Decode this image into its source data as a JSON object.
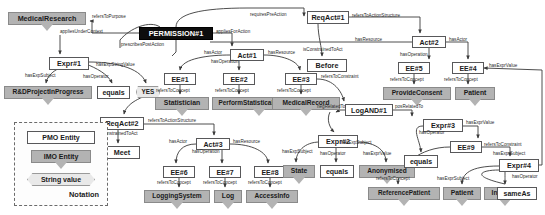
{
  "diagram": {
    "colors": {
      "pmo_fill": "#ffffff",
      "imo_fill": "#b3b3b3",
      "string_fill": "#e9e9e9",
      "permission_fill": "#0d0d0d",
      "edge": "#3a3a3a"
    }
  },
  "legend": {
    "items": [
      {
        "label": "PMO Entity",
        "kind": "pmo"
      },
      {
        "label": "IMO Entity",
        "kind": "imo"
      },
      {
        "label": "String value",
        "kind": "strval"
      }
    ],
    "note": "Notation"
  },
  "nodes": [
    {
      "id": "medicalresearch",
      "label": "MedicalResearch",
      "kind": "imo",
      "x": 8,
      "y": 12,
      "w": 78,
      "h": 13,
      "fs": 7.2
    },
    {
      "id": "permission1",
      "label": "PERMISSION#1",
      "kind": "perm",
      "x": 139,
      "y": 27,
      "w": 74,
      "h": 13,
      "fs": 7.4
    },
    {
      "id": "reqact1",
      "label": "ReqAct#1",
      "kind": "pmo",
      "x": 307,
      "y": 11,
      "w": 42,
      "h": 13,
      "fs": 7.2
    },
    {
      "id": "expr1",
      "label": "Expr#1",
      "kind": "pmo",
      "x": 49,
      "y": 57,
      "w": 40,
      "h": 13,
      "fs": 7.2
    },
    {
      "id": "rdproject",
      "label": "R&DProjectInProgress",
      "kind": "imo",
      "x": 4,
      "y": 86,
      "w": 88,
      "h": 13,
      "fs": 6.6
    },
    {
      "id": "equals1",
      "label": "equals",
      "kind": "pmo",
      "x": 97,
      "y": 86,
      "w": 33,
      "h": 13,
      "fs": 7.0
    },
    {
      "id": "yes",
      "label": "YES",
      "kind": "strval",
      "x": 136,
      "y": 86,
      "w": 24,
      "h": 12,
      "fs": 6.4
    },
    {
      "id": "act1",
      "label": "Act#1",
      "kind": "pmo",
      "x": 230,
      "y": 49,
      "w": 34,
      "h": 12,
      "fs": 7.0
    },
    {
      "id": "act2",
      "label": "Act#2",
      "kind": "pmo",
      "x": 412,
      "y": 36,
      "w": 34,
      "h": 12,
      "fs": 7.0
    },
    {
      "id": "before",
      "label": "Before",
      "kind": "pmo",
      "x": 307,
      "y": 59,
      "w": 40,
      "h": 13,
      "fs": 7.2
    },
    {
      "id": "ee1",
      "label": "EE#1",
      "kind": "pmo",
      "x": 164,
      "y": 73,
      "w": 32,
      "h": 12,
      "fs": 7.0
    },
    {
      "id": "ee2",
      "label": "EE#2",
      "kind": "pmo",
      "x": 223,
      "y": 73,
      "w": 32,
      "h": 12,
      "fs": 7.0
    },
    {
      "id": "ee3",
      "label": "EE#3",
      "kind": "pmo",
      "x": 285,
      "y": 73,
      "w": 32,
      "h": 12,
      "fs": 7.0
    },
    {
      "id": "ee5",
      "label": "EE#5",
      "kind": "pmo",
      "x": 398,
      "y": 62,
      "w": 32,
      "h": 12,
      "fs": 7.0
    },
    {
      "id": "ee4",
      "label": "EE#4",
      "kind": "pmo",
      "x": 452,
      "y": 62,
      "w": 32,
      "h": 12,
      "fs": 7.0
    },
    {
      "id": "statistician",
      "label": "Statistician",
      "kind": "imo",
      "x": 155,
      "y": 97,
      "w": 54,
      "h": 13,
      "fs": 6.8
    },
    {
      "id": "performstat",
      "label": "PerformStatisticalAnalysis",
      "kind": "imo",
      "x": 212,
      "y": 97,
      "w": 94,
      "h": 13,
      "fs": 6.4
    },
    {
      "id": "medicalrecord",
      "label": "MedicalRecord",
      "kind": "imo",
      "x": 272,
      "y": 97,
      "w": 68,
      "h": 13,
      "fs": 6.6
    },
    {
      "id": "provideconsent",
      "label": "ProvideConsent",
      "kind": "imo",
      "x": 383,
      "y": 87,
      "w": 68,
      "h": 13,
      "fs": 6.6
    },
    {
      "id": "patient1",
      "label": "Patient",
      "kind": "imo",
      "x": 455,
      "y": 87,
      "w": 40,
      "h": 13,
      "fs": 6.8
    },
    {
      "id": "logand1",
      "label": "LogAND#1",
      "kind": "pmo",
      "x": 345,
      "y": 104,
      "w": 48,
      "h": 12,
      "fs": 7.0
    },
    {
      "id": "reqact2",
      "label": "ReqAct#2",
      "kind": "pmo",
      "x": 100,
      "y": 117,
      "w": 44,
      "h": 13,
      "fs": 7.2
    },
    {
      "id": "meet",
      "label": "Meet",
      "kind": "pmo",
      "x": 104,
      "y": 146,
      "w": 36,
      "h": 13,
      "fs": 7.2
    },
    {
      "id": "act3",
      "label": "Act#3",
      "kind": "pmo",
      "x": 196,
      "y": 138,
      "w": 34,
      "h": 12,
      "fs": 7.0
    },
    {
      "id": "ee6",
      "label": "EE#6",
      "kind": "pmo",
      "x": 163,
      "y": 166,
      "w": 32,
      "h": 12,
      "fs": 7.0
    },
    {
      "id": "ee7",
      "label": "EE#7",
      "kind": "pmo",
      "x": 209,
      "y": 166,
      "w": 32,
      "h": 12,
      "fs": 7.0
    },
    {
      "id": "ee8",
      "label": "EE#8",
      "kind": "pmo",
      "x": 254,
      "y": 166,
      "w": 32,
      "h": 12,
      "fs": 7.0
    },
    {
      "id": "loggingsystem",
      "label": "LoggingSystem",
      "kind": "imo",
      "x": 144,
      "y": 190,
      "w": 66,
      "h": 13,
      "fs": 6.6
    },
    {
      "id": "log",
      "label": "Log",
      "kind": "imo",
      "x": 214,
      "y": 190,
      "w": 28,
      "h": 13,
      "fs": 6.8
    },
    {
      "id": "accessinfo",
      "label": "AccessInfo",
      "kind": "imo",
      "x": 246,
      "y": 190,
      "w": 52,
      "h": 13,
      "fs": 6.6
    },
    {
      "id": "expr2",
      "label": "Expr#2",
      "kind": "pmo",
      "x": 318,
      "y": 135,
      "w": 40,
      "h": 13,
      "fs": 7.2
    },
    {
      "id": "state",
      "label": "State",
      "kind": "imo",
      "x": 283,
      "y": 165,
      "w": 32,
      "h": 13,
      "fs": 6.8
    },
    {
      "id": "equals2",
      "label": "equals",
      "kind": "pmo",
      "x": 320,
      "y": 165,
      "w": 34,
      "h": 13,
      "fs": 7.0
    },
    {
      "id": "anonymised",
      "label": "Anonymised",
      "kind": "imo",
      "x": 359,
      "y": 165,
      "w": 56,
      "h": 13,
      "fs": 6.6
    },
    {
      "id": "expr3",
      "label": "Expr#3",
      "kind": "pmo",
      "x": 423,
      "y": 119,
      "w": 40,
      "h": 13,
      "fs": 7.2
    },
    {
      "id": "ee9",
      "label": "EE#9",
      "kind": "pmo",
      "x": 450,
      "y": 141,
      "w": 32,
      "h": 12,
      "fs": 7.0
    },
    {
      "id": "equals3",
      "label": "equals",
      "kind": "pmo",
      "x": 404,
      "y": 155,
      "w": 34,
      "h": 13,
      "fs": 7.0
    },
    {
      "id": "expr4",
      "label": "Expr#4",
      "kind": "pmo",
      "x": 499,
      "y": 159,
      "w": 40,
      "h": 13,
      "fs": 7.2
    },
    {
      "id": "referencepatient",
      "label": "ReferencePatient",
      "kind": "imo",
      "x": 368,
      "y": 187,
      "w": 72,
      "h": 13,
      "fs": 6.4
    },
    {
      "id": "patient2",
      "label": "Patient",
      "kind": "imo",
      "x": 443,
      "y": 187,
      "w": 38,
      "h": 13,
      "fs": 6.8
    },
    {
      "id": "instance",
      "label": "Instance",
      "kind": "imo",
      "x": 484,
      "y": 187,
      "w": 42,
      "h": 13,
      "fs": 6.6
    },
    {
      "id": "sameas",
      "label": "sameAs",
      "kind": "pmo",
      "x": 497,
      "y": 187,
      "w": 40,
      "h": 13,
      "fs": 7.0
    }
  ],
  "edge_labels": [
    {
      "text": "refersToPurpose",
      "x": 92,
      "y": 15,
      "fs": 4.6
    },
    {
      "text": "requiresPreAction",
      "x": 250,
      "y": 13,
      "fs": 4.6
    },
    {
      "text": "appliesUnderContext",
      "x": 60,
      "y": 30,
      "fs": 4.6
    },
    {
      "text": "appliesForAction",
      "x": 216,
      "y": 30,
      "fs": 4.6
    },
    {
      "text": "refersToActionStructure",
      "x": 352,
      "y": 14,
      "fs": 4.6
    },
    {
      "text": "prescribesPostAction",
      "x": 121,
      "y": 43,
      "fs": 4.6
    },
    {
      "text": "hasResource",
      "x": 355,
      "y": 38,
      "fs": 4.6
    },
    {
      "text": "hasActor",
      "x": 449,
      "y": 38,
      "fs": 4.6
    },
    {
      "text": "hasActor",
      "x": 204,
      "y": 51,
      "fs": 4.6
    },
    {
      "text": "hasResource",
      "x": 268,
      "y": 51,
      "fs": 4.6
    },
    {
      "text": "isConstrainedToAct",
      "x": 303,
      "y": 48,
      "fs": 4.6
    },
    {
      "text": "hasOperation",
      "x": 211,
      "y": 60,
      "fs": 4.6
    },
    {
      "text": "hasOperation",
      "x": 400,
      "y": 53,
      "fs": 4.6
    },
    {
      "text": "hasExprValue",
      "x": 489,
      "y": 64,
      "fs": 4.6
    },
    {
      "text": "hasExpSubject",
      "x": 25,
      "y": 74,
      "fs": 4.6
    },
    {
      "text": "hasOperator",
      "x": 83,
      "y": 75,
      "fs": 4.6
    },
    {
      "text": "hasExpStringValue",
      "x": 96,
      "y": 63,
      "fs": 4.6
    },
    {
      "text": "refersToConstraint",
      "x": 321,
      "y": 75,
      "fs": 4.6
    },
    {
      "text": "refersToConcept",
      "x": 156,
      "y": 89,
      "fs": 4.6
    },
    {
      "text": "refersToConcept",
      "x": 215,
      "y": 89,
      "fs": 4.6
    },
    {
      "text": "refersToConcept",
      "x": 277,
      "y": 89,
      "fs": 4.6
    },
    {
      "text": "refersToConcept",
      "x": 390,
      "y": 78,
      "fs": 4.6
    },
    {
      "text": "refersToConcept",
      "x": 444,
      "y": 78,
      "fs": 4.6
    },
    {
      "text": "negRelatedTo",
      "x": 317,
      "y": 105,
      "fs": 4.6
    },
    {
      "text": "posRelatedTo",
      "x": 395,
      "y": 105,
      "fs": 4.6
    },
    {
      "text": "refersToActionStructure",
      "x": 148,
      "y": 119,
      "fs": 4.6
    },
    {
      "text": "isConstrainedToAct",
      "x": 98,
      "y": 132,
      "fs": 4.6
    },
    {
      "text": "hasActor",
      "x": 169,
      "y": 140,
      "fs": 4.6
    },
    {
      "text": "hasResource",
      "x": 233,
      "y": 140,
      "fs": 4.6
    },
    {
      "text": "hasOperation",
      "x": 192,
      "y": 150,
      "fs": 4.6
    },
    {
      "text": "hasExprValue",
      "x": 466,
      "y": 121,
      "fs": 4.6
    },
    {
      "text": "hasOperator",
      "x": 419,
      "y": 131,
      "fs": 4.6
    },
    {
      "text": "hasExpSubject",
      "x": 341,
      "y": 141,
      "fs": 4.6
    },
    {
      "text": "refersToConstraint",
      "x": 484,
      "y": 143,
      "fs": 4.6
    },
    {
      "text": "hasExpSubject",
      "x": 282,
      "y": 150,
      "fs": 4.6
    },
    {
      "text": "hasOperator",
      "x": 320,
      "y": 152,
      "fs": 4.6
    },
    {
      "text": "hasExprValue",
      "x": 363,
      "y": 152,
      "fs": 4.6
    },
    {
      "text": "hasExprSubject",
      "x": 493,
      "y": 152,
      "fs": 4.6
    },
    {
      "text": "hasOperator",
      "x": 512,
      "y": 175,
      "fs": 4.6
    },
    {
      "text": "refersToConcept",
      "x": 376,
      "y": 177,
      "fs": 4.6
    },
    {
      "text": "hasExprSubject",
      "x": 437,
      "y": 177,
      "fs": 4.6
    },
    {
      "text": "refersToConcept",
      "x": 157,
      "y": 181,
      "fs": 4.6
    },
    {
      "text": "refersToConcept",
      "x": 203,
      "y": 181,
      "fs": 4.6
    },
    {
      "text": "refersToConcept",
      "x": 248,
      "y": 181,
      "fs": 4.6
    }
  ],
  "edges": [
    {
      "d": "M 139,33 L 92,33 L 92,21 L 90,21",
      "arrow": true,
      "name": "permission-to-medicalresearch"
    },
    {
      "d": "M 176,27 C 176,14 200,8 248,8 L 304,8 L 304,16",
      "arrow": true,
      "name": "permission-to-reqact1"
    },
    {
      "d": "M 160,27 C 150,20 130,28 120,40 L 120,48",
      "arrow": false,
      "name": "permission-context-stub"
    },
    {
      "d": "M 60,35 L 60,54",
      "arrow": true,
      "name": "context-to-expr1"
    },
    {
      "d": "M 176,40 L 176,52 L 172,56",
      "arrow": false,
      "name": "permission-postaction-stub"
    },
    {
      "d": "M 213,33 L 232,33 L 232,46",
      "arrow": true,
      "name": "permission-to-act1"
    },
    {
      "d": "M 349,17 L 420,17 L 420,33",
      "arrow": true,
      "name": "reqact1-to-act2"
    },
    {
      "d": "M 412,42 L 350,42 L 210,42",
      "arrow": false,
      "name": "act2-resource-line"
    },
    {
      "d": "M 446,42 L 468,42 L 468,59",
      "arrow": true,
      "name": "act2-to-ee4"
    },
    {
      "d": "M 429,48 L 429,59",
      "arrow": true,
      "name": "act2-to-ee5"
    },
    {
      "d": "M 318,24 C 318,36 322,48 322,56",
      "arrow": true,
      "name": "reqact1-to-before"
    },
    {
      "d": "M 230,55 C 210,55 182,58 180,70",
      "arrow": true,
      "name": "act1-to-ee1"
    },
    {
      "d": "M 264,55 C 280,55 298,60 300,70",
      "arrow": true,
      "name": "act1-to-ee3"
    },
    {
      "d": "M 239,61 L 239,70",
      "arrow": true,
      "name": "act1-to-ee2"
    },
    {
      "d": "M 80,64 C 62,64 48,72 46,83",
      "arrow": true,
      "name": "expr1-to-rdproject"
    },
    {
      "d": "M 86,64 C 96,68 108,74 112,83",
      "arrow": true,
      "name": "expr1-to-equals"
    },
    {
      "d": "M 89,62 C 110,62 140,66 146,83",
      "arrow": true,
      "name": "expr1-to-yes"
    },
    {
      "d": "M 180,85 L 180,94",
      "arrow": true,
      "name": "ee1-to-statistician"
    },
    {
      "d": "M 239,85 L 239,94",
      "arrow": true,
      "name": "ee2-to-performstat"
    },
    {
      "d": "M 301,85 L 301,94",
      "arrow": true,
      "name": "ee3-to-medicalrecord"
    },
    {
      "d": "M 414,74 L 414,84",
      "arrow": true,
      "name": "ee5-to-provideconsent"
    },
    {
      "d": "M 468,74 L 468,84",
      "arrow": true,
      "name": "ee4-to-patient"
    },
    {
      "d": "M 317,79 C 334,79 342,92 344,101",
      "arrow": true,
      "name": "ee3-to-logand1"
    },
    {
      "d": "M 345,110 L 340,110 L 336,112",
      "arrow": true,
      "name": "logand1-neg-stub"
    },
    {
      "d": "M 330,112 C 326,120 330,128 334,132",
      "arrow": true,
      "name": "logand1-to-expr2"
    },
    {
      "d": "M 393,110 L 412,110 L 412,116",
      "arrow": true,
      "name": "logand1-to-expr3"
    },
    {
      "d": "M 160,92 C 140,96 126,104 124,114",
      "arrow": true,
      "name": "permission-to-reqact2"
    },
    {
      "d": "M 144,124 L 214,124 L 214,135",
      "arrow": true,
      "name": "reqact2-to-act3"
    },
    {
      "d": "M 118,130 L 118,143",
      "arrow": true,
      "name": "reqact2-to-meet"
    },
    {
      "d": "M 196,144 C 182,144 176,152 176,163",
      "arrow": true,
      "name": "act3-to-ee6"
    },
    {
      "d": "M 230,144 C 252,144 268,152 268,163",
      "arrow": true,
      "name": "act3-to-ee8"
    },
    {
      "d": "M 222,150 L 222,163",
      "arrow": true,
      "name": "act3-to-ee7"
    },
    {
      "d": "M 179,178 L 179,187",
      "arrow": true,
      "name": "ee6-to-loggingsystem"
    },
    {
      "d": "M 225,178 L 225,187",
      "arrow": true,
      "name": "ee7-to-log"
    },
    {
      "d": "M 270,178 L 270,187",
      "arrow": true,
      "name": "ee8-to-accessinfo"
    },
    {
      "d": "M 320,142 C 304,142 296,152 296,162",
      "arrow": true,
      "name": "expr2-to-state"
    },
    {
      "d": "M 336,148 L 336,162",
      "arrow": true,
      "name": "expr2-to-equals2"
    },
    {
      "d": "M 356,142 C 378,142 386,152 386,162",
      "arrow": true,
      "name": "expr2-to-anonymised"
    },
    {
      "d": "M 423,126 C 410,126 420,140 421,152",
      "arrow": true,
      "name": "expr3-to-equals3"
    },
    {
      "d": "M 463,126 L 478,126 L 478,138",
      "arrow": true,
      "name": "expr3-to-ee9"
    },
    {
      "d": "M 450,147 C 420,147 398,166 398,184",
      "arrow": true,
      "name": "ee9-to-referencepatient"
    },
    {
      "d": "M 482,147 L 510,147 L 510,156",
      "arrow": true,
      "name": "ee9-to-expr4"
    },
    {
      "d": "M 499,166 C 470,166 462,174 462,184",
      "arrow": true,
      "name": "expr4-to-patient2"
    },
    {
      "d": "M 505,172 C 505,178 505,180 505,184",
      "arrow": true,
      "name": "expr4-to-sameas"
    },
    {
      "d": "M 499,170 C 480,170 470,176 505,184",
      "arrow": false,
      "name": "expr4-instance-link"
    },
    {
      "d": "M 538,165 L 542,165 L 542,70 L 484,68",
      "arrow": true,
      "name": "expr4-to-ee4-value"
    }
  ]
}
